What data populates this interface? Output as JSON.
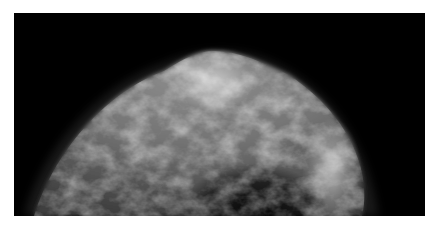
{
  "image": {
    "subject": "grayscale radiographic breast tissue image (mammogram-style)",
    "background": "#ffffff",
    "frame_color": "#000000",
    "tissue_highlight": "#e6e6e6"
  }
}
